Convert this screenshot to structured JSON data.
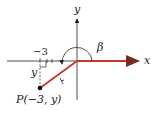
{
  "diagram": {
    "axes": {
      "x_label": "x",
      "y_label": "y"
    },
    "angle_label": "β",
    "tick_label": "−3",
    "vertical_label": "y",
    "point_label": "P(−3, y)",
    "colors": {
      "terminal_side": "#c0392b",
      "axes": "#222222",
      "arc": "#222222"
    }
  }
}
